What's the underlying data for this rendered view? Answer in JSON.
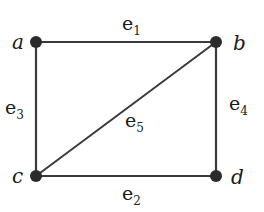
{
  "graph": {
    "nodes": [
      {
        "id": "a",
        "label": "a",
        "x": 36,
        "y": 42
      },
      {
        "id": "b",
        "label": "b",
        "x": 216,
        "y": 42
      },
      {
        "id": "c",
        "label": "c",
        "x": 36,
        "y": 176
      },
      {
        "id": "d",
        "label": "d",
        "x": 216,
        "y": 176
      }
    ],
    "edges": [
      {
        "id": "e1",
        "label": "e",
        "sub": "1",
        "from": "a",
        "to": "b"
      },
      {
        "id": "e2",
        "label": "e",
        "sub": "2",
        "from": "c",
        "to": "d"
      },
      {
        "id": "e3",
        "label": "e",
        "sub": "3",
        "from": "a",
        "to": "c"
      },
      {
        "id": "e4",
        "label": "e",
        "sub": "4",
        "from": "b",
        "to": "d"
      },
      {
        "id": "e5",
        "label": "e",
        "sub": "5",
        "from": "c",
        "to": "b"
      }
    ],
    "colors": {
      "edge": "#3a3a3a",
      "node": "#2b2b2b",
      "text": "#1a1a1a"
    }
  }
}
